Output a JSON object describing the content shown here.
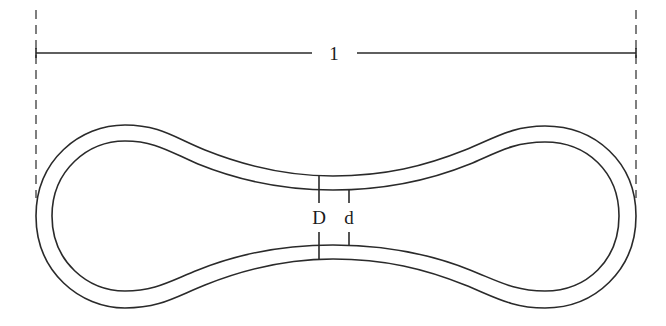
{
  "diagram": {
    "type": "cross-section of a dumbbell/peanut-shaped closed loop (tube wall)",
    "length_label": "1",
    "outer_diameter_label": "D",
    "inner_diameter_label": "d",
    "colors": {
      "line": "#2a2a2a",
      "background": "#ffffff"
    }
  }
}
